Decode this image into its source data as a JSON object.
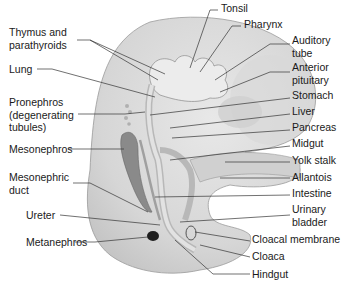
{
  "diagram": {
    "type": "embryo-anatomy",
    "colors": {
      "body": "#d7d7d7",
      "body_light": "#e6e6e6",
      "gut": "#c6c6c6",
      "mesonephros": "#8a8a8a",
      "metanephros": "#222222",
      "leader": "#333333"
    },
    "labels_left": [
      {
        "id": "thymus",
        "lines": [
          "Thymus and",
          "parathyroids"
        ]
      },
      {
        "id": "lung",
        "lines": [
          "Lung"
        ]
      },
      {
        "id": "pronephros",
        "lines": [
          "Pronephros",
          "(degenerating",
          "tubules)"
        ]
      },
      {
        "id": "mesonephros",
        "lines": [
          "Mesonephros"
        ]
      },
      {
        "id": "mesonephric-duct",
        "lines": [
          "Mesonephric",
          "duct"
        ]
      },
      {
        "id": "ureter",
        "lines": [
          "Ureter"
        ]
      },
      {
        "id": "metanephros",
        "lines": [
          "Metanephros"
        ]
      }
    ],
    "labels_right": [
      {
        "id": "tonsil",
        "lines": [
          "Tonsil"
        ]
      },
      {
        "id": "pharynx",
        "lines": [
          "Pharynx"
        ]
      },
      {
        "id": "auditory-tube",
        "lines": [
          "Auditory",
          "tube"
        ]
      },
      {
        "id": "anterior-pituitary",
        "lines": [
          "Anterior",
          "pituitary"
        ]
      },
      {
        "id": "stomach",
        "lines": [
          "Stomach"
        ]
      },
      {
        "id": "liver",
        "lines": [
          "Liver"
        ]
      },
      {
        "id": "pancreas",
        "lines": [
          "Pancreas"
        ]
      },
      {
        "id": "midgut",
        "lines": [
          "Midgut"
        ]
      },
      {
        "id": "yolk-stalk",
        "lines": [
          "Yolk stalk"
        ]
      },
      {
        "id": "allantois",
        "lines": [
          "Allantois"
        ]
      },
      {
        "id": "intestine",
        "lines": [
          "Intestine"
        ]
      },
      {
        "id": "urinary-bladder",
        "lines": [
          "Urinary",
          "bladder"
        ]
      },
      {
        "id": "cloacal-membrane",
        "lines": [
          "Cloacal membrane"
        ]
      },
      {
        "id": "cloaca",
        "lines": [
          "Cloaca"
        ]
      },
      {
        "id": "hindgut",
        "lines": [
          "Hindgut"
        ]
      }
    ]
  }
}
